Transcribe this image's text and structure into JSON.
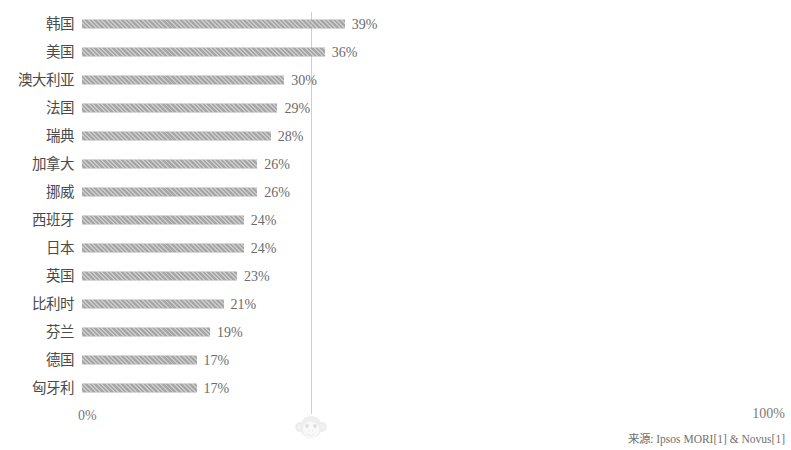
{
  "chart_data": {
    "type": "bar",
    "orientation": "horizontal",
    "title": "",
    "subtitle": "",
    "xlabel": "",
    "ylabel": "",
    "xlim": [
      0,
      100
    ],
    "grid": false,
    "legend": null,
    "value_suffix": "%",
    "categories": [
      "韩国",
      "美国",
      "澳大利亚",
      "法国",
      "瑞典",
      "加拿大",
      "挪威",
      "西班牙",
      "日本",
      "英国",
      "比利时",
      "芬兰",
      "德国",
      "匈牙利"
    ],
    "values": [
      39,
      36,
      30,
      29,
      28,
      26,
      26,
      24,
      24,
      23,
      21,
      19,
      17,
      17
    ],
    "value_labels": [
      "39%",
      "36%",
      "30%",
      "29%",
      "28%",
      "26%",
      "26%",
      "24%",
      "24%",
      "23%",
      "21%",
      "19%",
      "17%",
      "17%"
    ],
    "axis_tick_labels": [
      "0%",
      "100%"
    ],
    "annotations": [
      {
        "name": "reference-line",
        "value": 34
      }
    ],
    "bar_color": "#a6a6a6",
    "text_color": "#595959",
    "reference_line_color": "#cfcfcf"
  },
  "axis": {
    "min_label": "0%",
    "max_label": "100%"
  },
  "footer": {
    "source": "来源: Ipsos MORI[1] & Novus[1]"
  },
  "watermark": {
    "top_band_text": "",
    "logo_name": "monkey-face-logo"
  }
}
